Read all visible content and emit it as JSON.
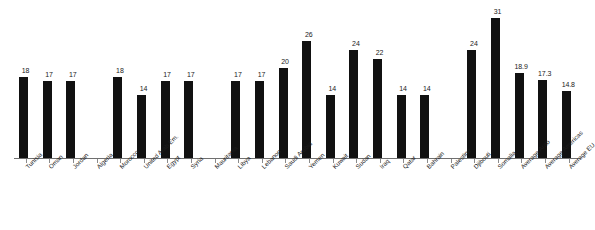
{
  "chart_data": {
    "type": "bar",
    "title": "",
    "subtitle": "",
    "xlabel": "",
    "ylabel": "",
    "ylim": [
      0,
      31
    ],
    "grid": false,
    "legend": null,
    "bar_color": "#111111",
    "axis_color": "#6f6f6f",
    "background": "#ffffff",
    "categories": [
      "Tunisia",
      "Oman",
      "Jordan",
      "Algeria",
      "Morocco",
      "United Arab Em.",
      "Egypt",
      "Syria",
      "Mauritania",
      "Libya",
      "Lebanon",
      "Saudi Arabia",
      "Yemen",
      "Kuwait",
      "Sudan",
      "Iraq",
      "Qatar",
      "Bahrain",
      "Palestine",
      "Djibouti",
      "Somalia",
      "Average Arab",
      "Average Americas",
      "Average EU"
    ],
    "values": [
      18,
      17,
      17,
      null,
      18,
      14,
      17,
      17,
      null,
      17,
      17,
      20,
      26,
      14,
      24,
      22,
      14,
      14,
      null,
      24,
      31,
      18.9,
      17.3,
      14.8
    ],
    "value_labels": [
      "18",
      "17",
      "17",
      "",
      "18",
      "14",
      "17",
      "17",
      "",
      "17",
      "17",
      "20",
      "26",
      "14",
      "24",
      "22",
      "14",
      "14",
      "",
      "24",
      "31",
      "18.9",
      "17.3",
      "14.8"
    ]
  }
}
